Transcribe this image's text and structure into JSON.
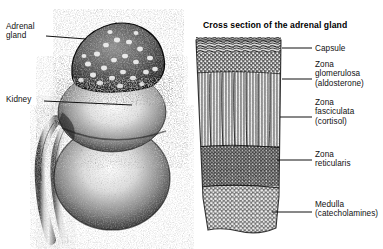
{
  "figure": {
    "background_color": "#ffffff",
    "ink_color": "#111111",
    "panels": [
      {
        "id": "whole-organ",
        "labels": [
          {
            "id": "adrenal",
            "text": "Adrenal\ngland"
          },
          {
            "id": "kidney",
            "text": "Kidney"
          }
        ]
      },
      {
        "id": "cross-section",
        "title": "Cross section of the adrenal gland",
        "labels": [
          {
            "id": "capsule",
            "text": "Capsule"
          },
          {
            "id": "glomerulosa",
            "text": "Zona\nglomerulosa\n(aldosterone)"
          },
          {
            "id": "fasciculata",
            "text": "Zona\nfasciculata\n(cortisol)"
          },
          {
            "id": "reticularis",
            "text": "Zona\nreticularis"
          },
          {
            "id": "medulla",
            "text": "Medulla\n(catecholamines)"
          }
        ]
      }
    ]
  }
}
